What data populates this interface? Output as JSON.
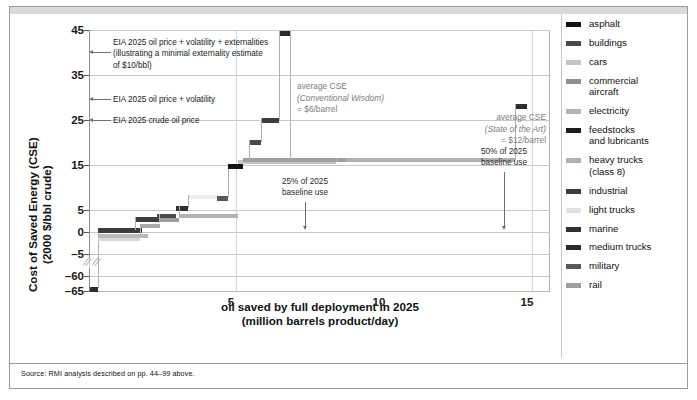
{
  "figure": {
    "source_note": "Source: RMI analysis described on pp. 44–99 above."
  },
  "chart_data": {
    "type": "bar",
    "title": "",
    "subtitle": "",
    "xlabel": "oil saved by full deployment in 2025",
    "xlabel_line2": "(million barrels product/day)",
    "ylabel": "Cost of Saved Energy (CSE)",
    "ylabel_line2": "(2000 $/bbl crude)",
    "xlim": [
      0,
      15.6
    ],
    "ylim": [
      -65,
      45
    ],
    "grid": true,
    "legend_position": "right",
    "y_ticks": [
      {
        "value": 45,
        "label": "45"
      },
      {
        "value": 35,
        "label": "35"
      },
      {
        "value": 25,
        "label": "25"
      },
      {
        "value": 15,
        "label": "15"
      },
      {
        "value": 5,
        "label": "5"
      },
      {
        "value": 0,
        "label": "0"
      },
      {
        "value": -5,
        "label": "–5"
      },
      {
        "value": -60,
        "label": "–60"
      },
      {
        "value": -65,
        "label": "–65"
      }
    ],
    "x_ticks": [
      {
        "value": 5,
        "label": "5"
      },
      {
        "value": 10,
        "label": "10"
      },
      {
        "value": 15,
        "label": "15"
      }
    ],
    "axis_break": {
      "between": [
        -5,
        -60
      ],
      "note": "y-axis break"
    },
    "reference_lines": [
      {
        "label": "EIA 2025 crude oil price",
        "value": 25
      },
      {
        "label": "EIA 2025 oil price + volatility",
        "value": 30
      },
      {
        "label": "EIA 2025 oil price + volatility + externalities (illustrating a minimal externality estimate of $10/bbl)",
        "value": 40
      }
    ],
    "annotations": [
      {
        "name": "eia-externalities",
        "text_lines": [
          "EIA 2025 oil price + volatility + externalities",
          "(illustrating a minimal externality estimate",
          "of $10/bbl)"
        ],
        "y_value": 40
      },
      {
        "name": "eia-volatility",
        "text_lines": [
          "EIA 2025 oil price + volatility"
        ],
        "y_value": 30
      },
      {
        "name": "eia-crude-price",
        "text_lines": [
          "EIA 2025 crude oil price"
        ],
        "y_value": 25
      },
      {
        "name": "avg-cse-conventional",
        "text_lines": [
          "average CSE",
          "(Conventional Wisdom)",
          "= $6/barrel"
        ],
        "value": 6,
        "unit": "$/barrel"
      },
      {
        "name": "avg-cse-state-of-art",
        "text_lines": [
          "average CSE",
          "(State of the Art)",
          "= $12/barrel"
        ],
        "value": 12,
        "unit": "$/barrel"
      },
      {
        "name": "baseline-25",
        "text_lines": [
          "25% of 2025",
          "baseline use"
        ],
        "x_value": 6.9
      },
      {
        "name": "baseline-50",
        "text_lines": [
          "50% of 2025",
          "baseline use"
        ],
        "x_value": 14.2
      }
    ],
    "steps": [
      {
        "name": "feedstocks and lubricants",
        "x0": 0.0,
        "x1": 0.22,
        "y": -65,
        "color": "#2e2e2e"
      },
      {
        "name": "light trucks",
        "x0": 0.22,
        "x1": 1.42,
        "y": -1.0,
        "color": "#d6d6d6"
      },
      {
        "name": "cars",
        "x0": 0.22,
        "x1": 1.7,
        "y": -0.3,
        "color": "#b9b9b9"
      },
      {
        "name": "industrial",
        "x0": 0.22,
        "x1": 1.52,
        "y": 0.3,
        "color": "#3d3d3d"
      },
      {
        "name": "heavy trucks (class 8)",
        "x0": 1.7,
        "x1": 2.4,
        "y": 1.3,
        "color": "#a8a8a8"
      },
      {
        "name": "medium trucks",
        "x0": 1.52,
        "x1": 2.3,
        "y": 2.9,
        "color": "#3d3d3d"
      },
      {
        "name": "buildings",
        "x0": 2.3,
        "x1": 2.95,
        "y": 3.4,
        "color": "#4a4a4a"
      },
      {
        "name": "rail",
        "x0": 2.4,
        "x1": 3.05,
        "y": 3.1,
        "color": "#9e9e9e"
      },
      {
        "name": "electricity",
        "x0": 3.05,
        "x1": 5.05,
        "y": 4.0,
        "color": "#b3b3b3"
      },
      {
        "name": "marine",
        "x0": 2.95,
        "x1": 3.35,
        "y": 5.9,
        "color": "#303030"
      },
      {
        "name": "commercial aircraft",
        "x0": 3.35,
        "x1": 4.35,
        "y": 8.3,
        "color": "#ededed"
      },
      {
        "name": "military",
        "x0": 4.35,
        "x1": 4.7,
        "y": 8.1,
        "color": "#595959"
      },
      {
        "name": "asphalt",
        "x0": 4.7,
        "x1": 5.35,
        "y": 15.1,
        "color": "#141414"
      },
      {
        "name": "cars-upper",
        "x0": 5.35,
        "x1": 8.7,
        "y": 16.6,
        "color": "#9e9e9e"
      },
      {
        "name": "light-trucks-upper",
        "x0": 5.05,
        "x1": 8.35,
        "y": 16.2,
        "color": "#c4c4c4"
      },
      {
        "name": "heavy-trucks-upper",
        "x0": 8.7,
        "x1": 14.4,
        "y": 16.6,
        "color": "#b0b0b0"
      },
      {
        "name": "buildings-upper",
        "x0": 5.55,
        "x1": 5.95,
        "y": 20.5,
        "color": "#4a4a4a"
      },
      {
        "name": "industrial-upper",
        "x0": 5.95,
        "x1": 6.55,
        "y": 25.1,
        "color": "#3d3d3d"
      },
      {
        "name": "medium-trucks-upper",
        "x0": 6.55,
        "x1": 6.95,
        "y": 44.6,
        "color": "#2b2b2b"
      },
      {
        "name": "electricity-upper",
        "x0": 14.4,
        "x1": 14.9,
        "y": 29.0,
        "color": "#2e2e2e"
      }
    ]
  },
  "legend": {
    "items": [
      {
        "label": "asphalt",
        "color": "#141414"
      },
      {
        "label": "buildings",
        "color": "#4a4a4a"
      },
      {
        "label": "cars",
        "color": "#c4c4c4"
      },
      {
        "label": "commercial\naircraft",
        "color": "#8f8f8f"
      },
      {
        "label": "electricity",
        "color": "#b3b3b3"
      },
      {
        "label": "feedstocks\nand lubricants",
        "color": "#1c1c1c"
      },
      {
        "label": "heavy trucks\n(class 8)",
        "color": "#b0b0b0"
      },
      {
        "label": "industrial",
        "color": "#3d3d3d"
      },
      {
        "label": "light trucks",
        "color": "#e2e2e2"
      },
      {
        "label": "marine",
        "color": "#303030"
      },
      {
        "label": "medium trucks",
        "color": "#2b2b2b"
      },
      {
        "label": "military",
        "color": "#595959"
      },
      {
        "label": "rail",
        "color": "#9e9e9e"
      }
    ]
  }
}
